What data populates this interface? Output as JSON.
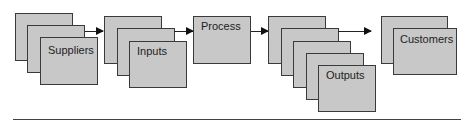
{
  "diagram": {
    "type": "flow",
    "nodes": [
      {
        "id": "suppliers",
        "label": "Suppliers",
        "stack": 3
      },
      {
        "id": "inputs",
        "label": "Inputs",
        "stack": 3
      },
      {
        "id": "process",
        "label": "Process",
        "stack": 1
      },
      {
        "id": "outputs",
        "label": "Outputs",
        "stack": 5
      },
      {
        "id": "customers",
        "label": "Customers",
        "stack": 2
      }
    ],
    "edges": [
      {
        "from": "suppliers",
        "to": "inputs"
      },
      {
        "from": "inputs",
        "to": "process"
      },
      {
        "from": "process",
        "to": "outputs"
      },
      {
        "from": "outputs",
        "to": "customers"
      }
    ],
    "colors": {
      "box_fill": "#c8c8c8",
      "box_border": "#3a3a3a",
      "arrow": "#111111"
    }
  }
}
